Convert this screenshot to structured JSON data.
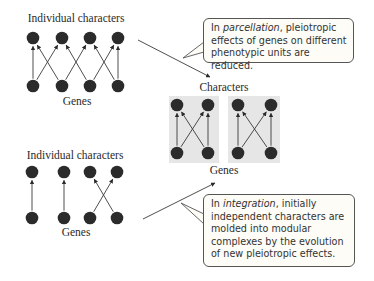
{
  "colors": {
    "dot": "#2b2b2b",
    "arrow": "#3a3a3a",
    "module_box": "#e6e6e6",
    "callout_border": "#555555",
    "callout_bg": "#fdfcf6",
    "text": "#2a2a2a"
  },
  "parcellation_panel": {
    "top_label": "Individual characters",
    "bottom_label": "Genes",
    "characters_x": [
      33,
      62,
      90,
      118
    ],
    "genes_x": [
      33,
      62,
      90,
      118
    ],
    "characters_y": 38,
    "genes_y": 86,
    "connections": [
      [
        0,
        0
      ],
      [
        0,
        1
      ],
      [
        1,
        0
      ],
      [
        1,
        2
      ],
      [
        2,
        1
      ],
      [
        2,
        3
      ],
      [
        3,
        2
      ],
      [
        3,
        3
      ]
    ]
  },
  "modular_panel": {
    "top_label": "Characters",
    "bottom_label": "Genes",
    "modules": [
      {
        "box": [
          169,
          96,
          50,
          67
        ],
        "dots_x": [
          177,
          208
        ],
        "connections": [
          [
            0,
            0
          ],
          [
            0,
            1
          ],
          [
            1,
            0
          ],
          [
            1,
            1
          ]
        ]
      },
      {
        "box": [
          228,
          96,
          52,
          67
        ],
        "dots_x": [
          238,
          271
        ],
        "connections": [
          [
            0,
            0
          ],
          [
            0,
            1
          ],
          [
            1,
            0
          ],
          [
            1,
            1
          ]
        ]
      }
    ],
    "characters_y": 105,
    "genes_y": 153
  },
  "integration_panel": {
    "top_label": "Individual characters",
    "bottom_label": "Genes",
    "characters_x": [
      32,
      64,
      90,
      117
    ],
    "genes_x": [
      32,
      64,
      90,
      117
    ],
    "characters_y": 172,
    "genes_y": 218,
    "connections": [
      [
        0,
        0
      ],
      [
        1,
        1
      ],
      [
        2,
        3
      ],
      [
        3,
        2
      ]
    ]
  },
  "callouts": {
    "top": {
      "prefix": "In ",
      "term": "parcellation",
      "text": ", pleiotropic effects of genes on different phenotypic units are reduced."
    },
    "bottom": {
      "prefix": "In ",
      "term": "integration",
      "text": ", initially independent characters are molded into modular complexes by the evolution of new pleiotropic effects."
    }
  }
}
